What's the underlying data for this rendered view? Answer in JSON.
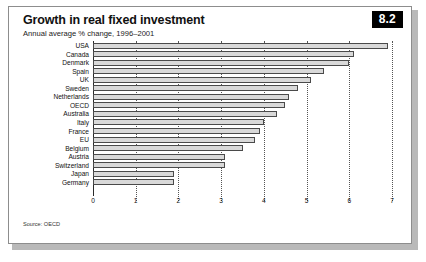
{
  "header": {
    "title": "Growth in real fixed investment",
    "subtitle": "Annual average % change, 1996–2001",
    "badge": "8.2"
  },
  "footer": {
    "source": "Source: OECD"
  },
  "colors": {
    "bar_fill": "#d9d9d9",
    "bar_stroke": "#4a4a4a",
    "badge_bg": "#000000",
    "grid": "#555555"
  },
  "chart_data": {
    "type": "bar",
    "orientation": "horizontal",
    "title": "Growth in real fixed investment",
    "subtitle": "Annual average % change, 1996–2001",
    "xlabel": "",
    "ylabel": "",
    "xlim": [
      0,
      7
    ],
    "xticks": [
      0,
      1,
      2,
      3,
      4,
      5,
      6,
      7
    ],
    "grid": true,
    "legend": false,
    "source": "Source: OECD",
    "categories": [
      "USA",
      "Canada",
      "Denmark",
      "Spain",
      "UK",
      "Sweden",
      "Netherlands",
      "OECD",
      "Australia",
      "Italy",
      "France",
      "EU",
      "Belgium",
      "Austria",
      "Switzerland",
      "Japan",
      "Germany"
    ],
    "values": [
      6.9,
      6.1,
      6.0,
      5.4,
      5.1,
      4.8,
      4.6,
      4.5,
      4.3,
      4.0,
      3.9,
      3.8,
      3.5,
      3.1,
      3.1,
      1.9,
      1.9
    ]
  }
}
